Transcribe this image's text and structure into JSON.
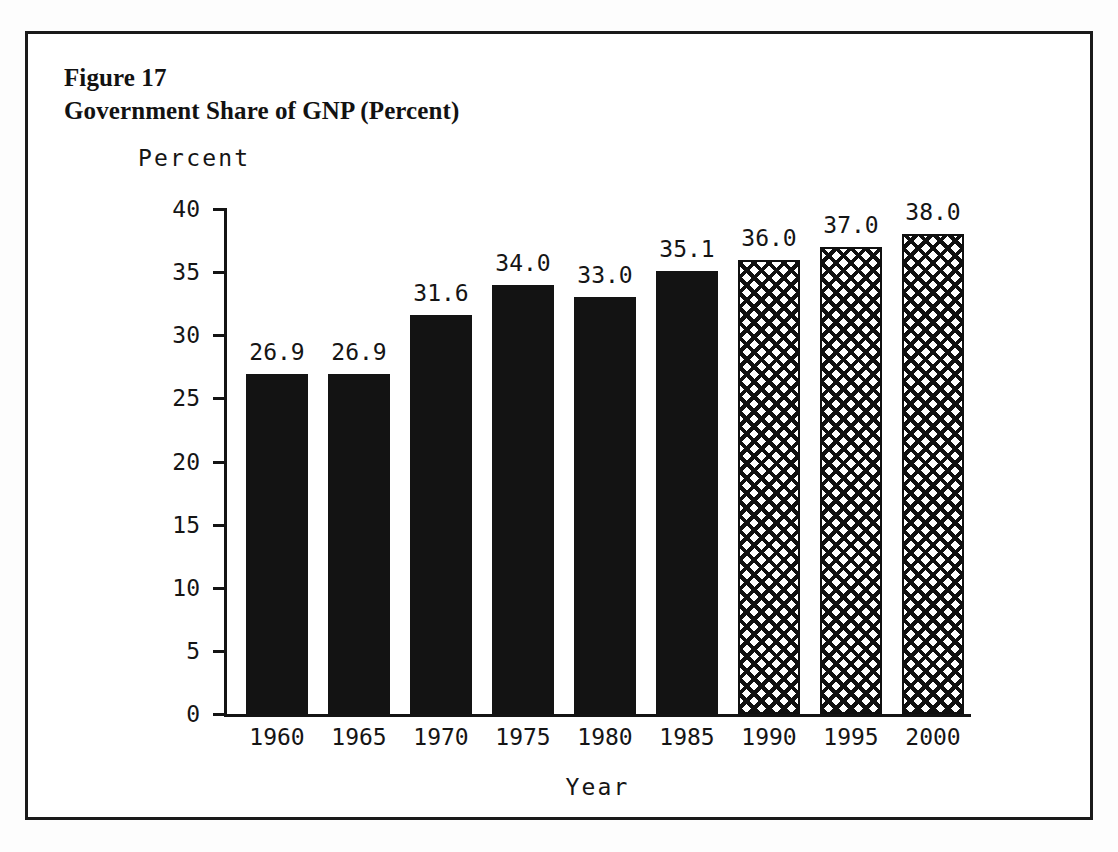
{
  "figure": {
    "label": "Figure 17",
    "title": "Government Share of GNP (Percent)"
  },
  "colors": {
    "ink": "#131313",
    "paper": "#ffffff",
    "border": "#1a1a1a"
  },
  "chart_data": {
    "type": "bar",
    "title": "Government Share of GNP (Percent)",
    "xlabel": "Year",
    "ylabel": "Percent",
    "ylim": [
      0,
      40
    ],
    "yticks": [
      0,
      5,
      10,
      15,
      20,
      25,
      30,
      35,
      40
    ],
    "ytick_labels": [
      "0",
      "5",
      "10",
      "15",
      "20",
      "25",
      "30",
      "35",
      "40"
    ],
    "grid": false,
    "legend": "none",
    "categories": [
      "1960",
      "1965",
      "1970",
      "1975",
      "1980",
      "1985",
      "1990",
      "1995",
      "2000"
    ],
    "values": [
      26.9,
      26.9,
      31.6,
      34.0,
      33.0,
      35.1,
      36.0,
      37.0,
      38.0
    ],
    "data_labels": [
      "26.9",
      "26.9",
      "31.6",
      "34.0",
      "33.0",
      "35.1",
      "36.0",
      "37.0",
      "38.0"
    ],
    "bar_styles": [
      "solid",
      "solid",
      "solid",
      "solid",
      "solid",
      "solid",
      "hatch",
      "hatch",
      "hatch"
    ]
  }
}
